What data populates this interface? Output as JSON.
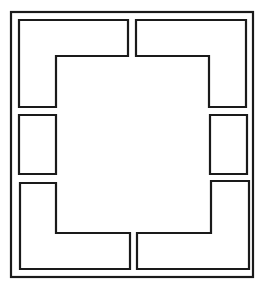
{
  "diagram": {
    "title": "",
    "stroke_color": "#1a1a1a",
    "background_color": "#ffffff",
    "outer_frame": {
      "x": 11,
      "y": 12,
      "width": 242,
      "height": 265
    },
    "panels": [
      {
        "id": "top-left-l",
        "shape": "L",
        "points": "19,20 128,20 128,56 56,56 56,107 19,107"
      },
      {
        "id": "top-right-l",
        "shape": "L",
        "points": "136,20 246,20 246,107 209,107 209,56 136,56"
      },
      {
        "id": "left-side-rect",
        "shape": "rect",
        "points": "19,115 56,115 56,174 19,174"
      },
      {
        "id": "right-side-rect",
        "shape": "rect",
        "points": "210,115 247,115 247,174 210,174"
      },
      {
        "id": "bottom-left-l",
        "shape": "L",
        "points": "20,183 56,183 56,233 130,233 130,269 20,269"
      },
      {
        "id": "bottom-right-l",
        "shape": "L",
        "points": "211,181 249,181 249,269 137,269 137,233 211,233"
      }
    ]
  }
}
